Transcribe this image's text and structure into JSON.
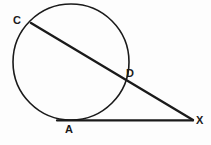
{
  "figure": {
    "background_color": "#fdfdfd",
    "stroke_color": "#1a1a1a",
    "label_color": "#1a1a1a"
  },
  "labels": {
    "c": "C",
    "d": "D",
    "a": "A",
    "x": "X"
  },
  "geometry": {
    "circle": {
      "cx": 71,
      "cy": 62,
      "r": 58,
      "stroke_width": 1.6
    },
    "secant": {
      "name": "secant-line-CX",
      "from": {
        "point": "C",
        "x": 31,
        "y": 23
      },
      "through": {
        "point": "D",
        "x": 122,
        "y": 77
      },
      "to": {
        "point": "X",
        "x": 193,
        "y": 120
      },
      "stroke_width": 2.4
    },
    "tangent": {
      "name": "tangent-line-AX",
      "from": {
        "point": "A",
        "x": 58,
        "y": 120
      },
      "touch": {
        "point": "A",
        "x": 70,
        "y": 120
      },
      "to": {
        "point": "X",
        "x": 193,
        "y": 120
      },
      "stroke_width": 2.2
    },
    "label_positions": {
      "c": {
        "x": 17,
        "y": 21
      },
      "d": {
        "x": 131,
        "y": 73
      },
      "a": {
        "x": 69,
        "y": 130
      },
      "x": {
        "x": 200,
        "y": 121
      }
    }
  }
}
